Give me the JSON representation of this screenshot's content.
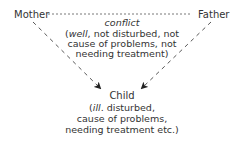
{
  "nodes": {
    "mother": "Mother",
    "father": "Father",
    "child": "Child"
  },
  "edge_label": {
    "title": "conflict",
    "lines": [
      {
        "italic": "well",
        "rest": ", not disturbed, not"
      },
      "cause of problems, not",
      "needing treatment)"
    ],
    "open_paren": "("
  },
  "child_desc": {
    "open_paren": "(",
    "italic": "ill",
    "rest": ". disturbed,",
    "lines": [
      "cause of problems,",
      "needing treatment etc.)"
    ]
  },
  "colors": {
    "text": "#333333",
    "line": "#333333"
  }
}
